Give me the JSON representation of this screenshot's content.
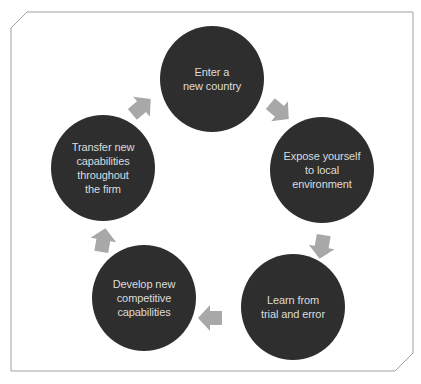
{
  "diagram": {
    "type": "cycle",
    "colors": {
      "node_fill": "#2e2e2e",
      "node_text": "#dcdcdc",
      "arrow": "#a8a8a8",
      "frame": "#a0a0a0",
      "background": "#ffffff"
    },
    "nodes": [
      {
        "id": "enter",
        "label": "Enter a\nnew country"
      },
      {
        "id": "expose",
        "label": "Expose yourself\nto local\nenvironment"
      },
      {
        "id": "learn",
        "label": "Learn from\ntrial and error"
      },
      {
        "id": "develop",
        "label": "Develop new\ncompetitive\ncapabilities"
      },
      {
        "id": "transfer",
        "label": "Transfer new\ncapabilities\nthroughout\nthe firm"
      }
    ],
    "edges": [
      {
        "from": "enter",
        "to": "expose"
      },
      {
        "from": "expose",
        "to": "learn"
      },
      {
        "from": "learn",
        "to": "develop"
      },
      {
        "from": "develop",
        "to": "transfer"
      },
      {
        "from": "transfer",
        "to": "enter"
      }
    ]
  }
}
